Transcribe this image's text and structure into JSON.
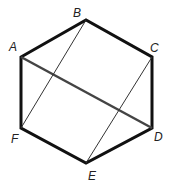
{
  "diagram": {
    "type": "regular hexagon with diagonals",
    "vertices": [
      "A",
      "B",
      "C",
      "D",
      "E",
      "F"
    ],
    "labels": {
      "A": "A",
      "B": "B",
      "C": "C",
      "D": "D",
      "E": "E",
      "F": "F"
    },
    "edges": [
      [
        "A",
        "B"
      ],
      [
        "B",
        "C"
      ],
      [
        "C",
        "D"
      ],
      [
        "D",
        "E"
      ],
      [
        "E",
        "F"
      ],
      [
        "F",
        "A"
      ]
    ],
    "thick_diagonal": [
      "A",
      "D"
    ],
    "thin_diagonals": [
      [
        "B",
        "F"
      ],
      [
        "C",
        "E"
      ]
    ],
    "colors": {
      "stroke": "#111111",
      "diagonal_ad": "#444444",
      "background": "#ffffff"
    }
  }
}
